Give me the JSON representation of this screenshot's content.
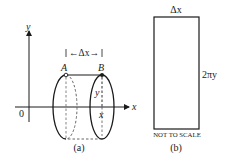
{
  "figure_a": {
    "caption": "(a)",
    "y_axis_label": "y",
    "x_axis_label": "x",
    "origin_label": "0",
    "point_a_label": "A",
    "point_b_label": "B",
    "delta_label": "←Δx→",
    "radius_label": "y",
    "position_label": "x"
  },
  "figure_b": {
    "caption": "(b)",
    "top_label": "Δx",
    "side_label": "2πy",
    "note": "NOT TO SCALE"
  },
  "colors": {
    "ink": "#1a1a1a",
    "background": "#ffffff"
  }
}
